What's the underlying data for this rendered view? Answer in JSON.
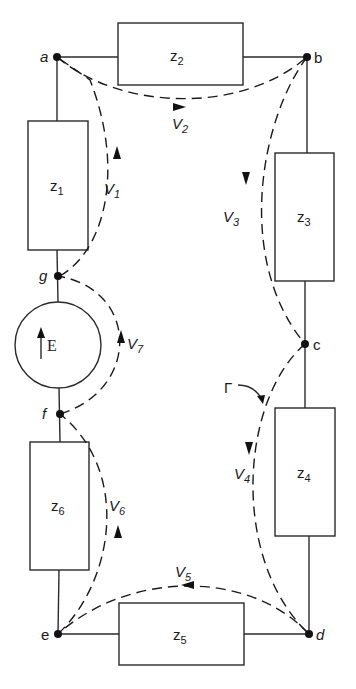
{
  "diagram": {
    "type": "circuit-loop",
    "nodes": [
      {
        "id": "a",
        "label": "a"
      },
      {
        "id": "b",
        "label": "b"
      },
      {
        "id": "c",
        "label": "c"
      },
      {
        "id": "d",
        "label": "d"
      },
      {
        "id": "e",
        "label": "e"
      },
      {
        "id": "f",
        "label": "f"
      },
      {
        "id": "g",
        "label": "g"
      }
    ],
    "impedances": [
      {
        "id": "z1",
        "base": "z",
        "sub": "1",
        "between": [
          "a",
          "g"
        ]
      },
      {
        "id": "z2",
        "base": "z",
        "sub": "2",
        "between": [
          "a",
          "b"
        ]
      },
      {
        "id": "z3",
        "base": "z",
        "sub": "3",
        "between": [
          "b",
          "c"
        ]
      },
      {
        "id": "z4",
        "base": "z",
        "sub": "4",
        "between": [
          "c",
          "d"
        ]
      },
      {
        "id": "z5",
        "base": "z",
        "sub": "5",
        "between": [
          "d",
          "e"
        ]
      },
      {
        "id": "z6",
        "base": "z",
        "sub": "6",
        "between": [
          "e",
          "f"
        ]
      }
    ],
    "source": {
      "id": "E",
      "label": "E",
      "between": [
        "f",
        "g"
      ],
      "direction": "up"
    },
    "voltages": [
      {
        "id": "V1",
        "base": "V",
        "sub": "1",
        "from": "g",
        "to": "a"
      },
      {
        "id": "V2",
        "base": "V",
        "sub": "2",
        "from": "a",
        "to": "b"
      },
      {
        "id": "V3",
        "base": "V",
        "sub": "3",
        "from": "b",
        "to": "c"
      },
      {
        "id": "V4",
        "base": "V",
        "sub": "4",
        "from": "c",
        "to": "d"
      },
      {
        "id": "V5",
        "base": "V",
        "sub": "5",
        "from": "d",
        "to": "e"
      },
      {
        "id": "V6",
        "base": "V",
        "sub": "6",
        "from": "e",
        "to": "f"
      },
      {
        "id": "V7",
        "base": "V",
        "sub": "7",
        "from": "f",
        "to": "g"
      }
    ],
    "contour": {
      "label": "Γ"
    }
  }
}
